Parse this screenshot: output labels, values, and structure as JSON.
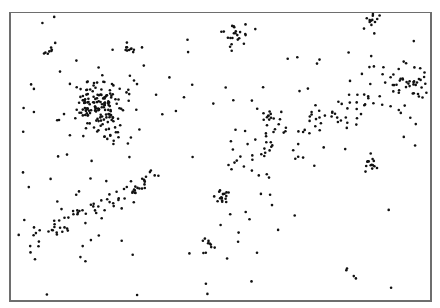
{
  "chart_data": {
    "type": "scatter",
    "title": "",
    "xlabel": "",
    "ylabel": "",
    "grid": false,
    "legend": null,
    "frame": {
      "x": 9,
      "y": 12,
      "width": 423,
      "height": 290
    },
    "point_color": "#111111",
    "point_radius": 1.3,
    "clusters": [
      {
        "name": "large-cluster",
        "cx": 100,
        "cy": 108,
        "spread": 16,
        "count": 170
      },
      {
        "name": "small-cluster-top-left",
        "cx": 50,
        "cy": 50,
        "spread": 3,
        "count": 8
      },
      {
        "name": "small-cluster-top-center",
        "cx": 129,
        "cy": 50,
        "spread": 3,
        "count": 10
      },
      {
        "name": "cluster-top-middle",
        "cx": 235,
        "cy": 36,
        "spread": 6,
        "count": 22
      },
      {
        "name": "cluster-top-right",
        "cx": 373,
        "cy": 18,
        "spread": 5,
        "count": 22
      },
      {
        "name": "cluster-right",
        "cx": 410,
        "cy": 82,
        "spread": 9,
        "count": 30
      },
      {
        "name": "cluster-center",
        "cx": 270,
        "cy": 116,
        "spread": 3,
        "count": 10
      },
      {
        "name": "cluster-right-middle",
        "cx": 373,
        "cy": 164,
        "spread": 4,
        "count": 14
      },
      {
        "name": "cluster-lower-center",
        "cx": 222,
        "cy": 197,
        "spread": 4,
        "count": 18
      },
      {
        "name": "cluster-bottom-center",
        "cx": 207,
        "cy": 245,
        "spread": 4,
        "count": 10
      },
      {
        "name": "band-lower-left",
        "x1": 30,
        "y1": 240,
        "x2": 160,
        "y2": 175,
        "width": 12,
        "count": 70,
        "kind": "band"
      },
      {
        "name": "band-upper-right",
        "x1": 240,
        "y1": 150,
        "x2": 400,
        "y2": 90,
        "width": 30,
        "count": 90,
        "kind": "band"
      }
    ],
    "background": {
      "count": 120
    },
    "seed": 7
  }
}
